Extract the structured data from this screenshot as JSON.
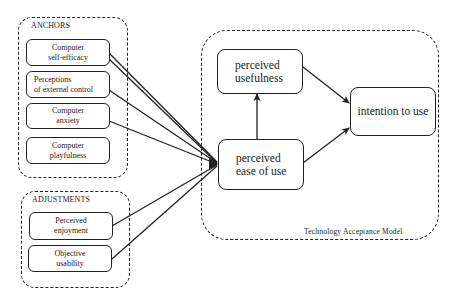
{
  "groups": {
    "anchors": {
      "label": "ANCHORS",
      "items": [
        {
          "line1": "Computer",
          "line2": "self-efficacy"
        },
        {
          "line1": "Perceptions",
          "line2": "of external control"
        },
        {
          "line1": "Computer",
          "line2": "anxiety"
        },
        {
          "line1": "Computer",
          "line2": "playfulness"
        }
      ]
    },
    "adjustments": {
      "label": "ADJUSTMENTS",
      "items": [
        {
          "line1": "Perceived",
          "line2": "enjoyment"
        },
        {
          "line1": "Objective",
          "line2": "usability"
        }
      ]
    },
    "tam": {
      "label": "Technology  Acceptance  Model",
      "nodes": {
        "usefulness": {
          "line1": "perceived",
          "line2": "usefulness"
        },
        "ease": {
          "line1": "perceived",
          "line2": "ease of use"
        },
        "intention": {
          "line1": "intention to use"
        }
      }
    }
  },
  "edges": [
    {
      "from": "Computer self-efficacy",
      "to": "perceived ease of use"
    },
    {
      "from": "Computer self-efficacy",
      "to": "perceived ease of use"
    },
    {
      "from": "Perceptions of external control",
      "to": "perceived ease of use"
    },
    {
      "from": "Computer anxiety",
      "to": "perceived ease of use"
    },
    {
      "from": "Perceived enjoyment",
      "to": "perceived ease of use"
    },
    {
      "from": "Objective usability",
      "to": "perceived ease of use"
    },
    {
      "from": "perceived ease of use",
      "to": "perceived usefulness"
    },
    {
      "from": "perceived usefulness",
      "to": "intention to use"
    },
    {
      "from": "perceived ease of use",
      "to": "intention to use"
    }
  ],
  "colors": {
    "stroke": "#222222",
    "background": "#ffffff"
  }
}
